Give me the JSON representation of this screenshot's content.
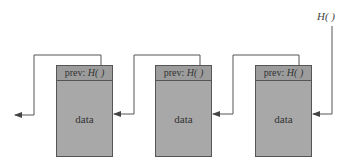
{
  "diagram": {
    "type": "hash-linked list (blockchain-style)",
    "head_pointer_label": "H( )",
    "nodes": [
      {
        "header_prefix": "prev: ",
        "header_hash": "H( )",
        "body": "data"
      },
      {
        "header_prefix": "prev: ",
        "header_hash": "H( )",
        "body": "data"
      },
      {
        "header_prefix": "prev: ",
        "header_hash": "H( )",
        "body": "data"
      }
    ],
    "colors": {
      "node_fill": "#a8a8a8",
      "header_fill": "#9c9c9c",
      "line": "#555555"
    }
  }
}
